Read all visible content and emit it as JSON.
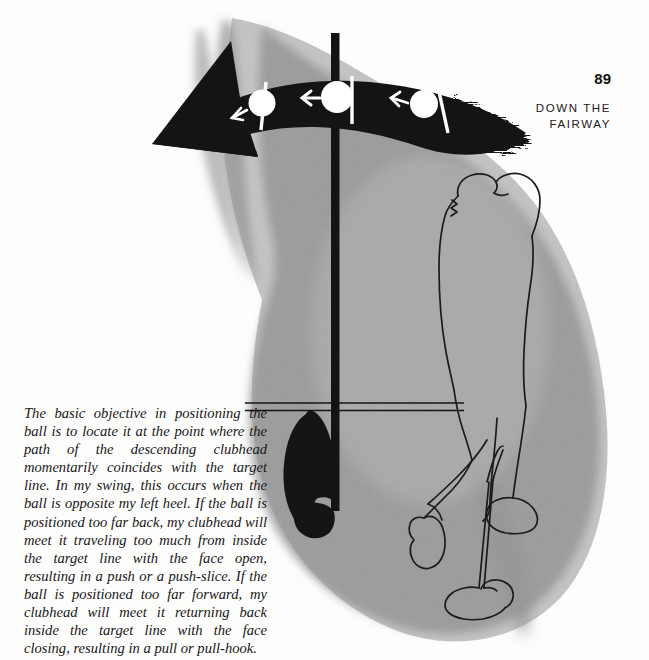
{
  "page": {
    "number": "89",
    "running_head_line1": "DOWN THE",
    "running_head_line2": "FAIRWAY",
    "width": 649,
    "height": 660
  },
  "caption": {
    "text": "The basic objective in positioning the ball is to locate it at the point where the path of the descending clubhead momentarily coincides with the target line. In my swing, this occurs when the ball is opposite my left heel. If the ball is positioned too far back, my clubhead will meet it traveling too much from inside the target line with the face open, resulting in a push or a push-slice. If the ball is positioned too far forward, my clubhead will meet it returning back inside the target line with the face closing, resulting in a pull or pull-hook."
  },
  "illustration": {
    "title": "Golf ball positioning relative to the target line",
    "elements": {
      "swing_path_arrow": "curved-black-arrow-pointing-left",
      "golf_balls_on_arrow": 3,
      "ball_direction_arrows": "small-white-left-arrows",
      "vertical_line": "ball-position-reference-line",
      "horizontal_line": "target-line-double-rule",
      "shoe": "black-shoe-sole-silhouette-left-heel",
      "golfer": "line-drawing-golfer-at-address",
      "club": "golf-club-shaft-and-clubhead",
      "shadow": "gray-textured-shadow-blob"
    }
  },
  "colors": {
    "paper": "#fdfdfc",
    "ink": "#111111",
    "shadow_gray": "#a9a9a9",
    "shadow_gray_dark": "#9a9a9a",
    "shadow_gray_light": "#c4c4c4",
    "white": "#ffffff"
  }
}
